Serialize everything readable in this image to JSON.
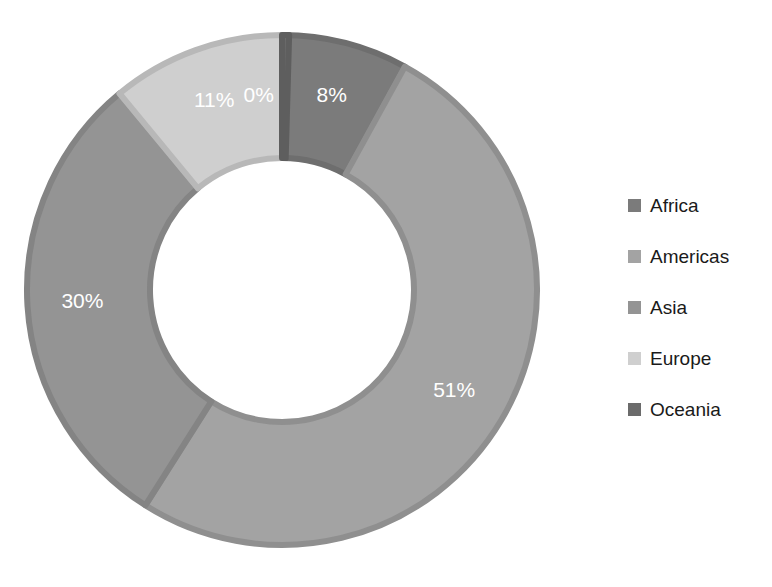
{
  "background_color": "#ffffff",
  "chart_data": {
    "type": "pie",
    "variant": "donut",
    "title": "",
    "subtitle": "",
    "xlabel": "",
    "ylabel": "",
    "grid": false,
    "legend_position": "right",
    "start_angle_deg": 0,
    "direction": "clockwise",
    "hole_ratio": 0.52,
    "categories": [
      "Africa",
      "Americas",
      "Asia",
      "Europe",
      "Oceania"
    ],
    "values": [
      8,
      51,
      30,
      11,
      0
    ],
    "value_unit": "%",
    "data_labels": [
      "8%",
      "51%",
      "30%",
      "11%",
      "0%"
    ],
    "data_label_color": "#ffffff",
    "colors": [
      "#7b7b7b",
      "#a3a3a3",
      "#949494",
      "#cfcfcf",
      "#6b6b6b"
    ],
    "border_colors": [
      "#6e6e6e",
      "#8f8f8f",
      "#848484",
      "#b8b8b8",
      "#5e5e5e"
    ],
    "slices": [
      {
        "label": "Africa",
        "value": 8,
        "data_label": "8%",
        "color": "#7b7b7b",
        "border_color": "#6e6e6e"
      },
      {
        "label": "Americas",
        "value": 51,
        "data_label": "51%",
        "color": "#a3a3a3",
        "border_color": "#8f8f8f"
      },
      {
        "label": "Asia",
        "value": 30,
        "data_label": "30%",
        "color": "#949494",
        "border_color": "#848484"
      },
      {
        "label": "Europe",
        "value": 11,
        "data_label": "11%",
        "color": "#cfcfcf",
        "border_color": "#b8b8b8"
      },
      {
        "label": "Oceania",
        "value": 0,
        "data_label": "0%",
        "color": "#6b6b6b",
        "border_color": "#5e5e5e"
      }
    ]
  },
  "legend": {
    "items": [
      {
        "label": "Africa",
        "color": "#7b7b7b"
      },
      {
        "label": "Americas",
        "color": "#a3a3a3"
      },
      {
        "label": "Asia",
        "color": "#949494"
      },
      {
        "label": "Europe",
        "color": "#cfcfcf"
      },
      {
        "label": "Oceania",
        "color": "#6b6b6b"
      }
    ]
  },
  "geometry": {
    "center_x": 282,
    "center_y": 290,
    "outer_radius": 255,
    "inner_radius": 132,
    "label_radius": 200
  }
}
